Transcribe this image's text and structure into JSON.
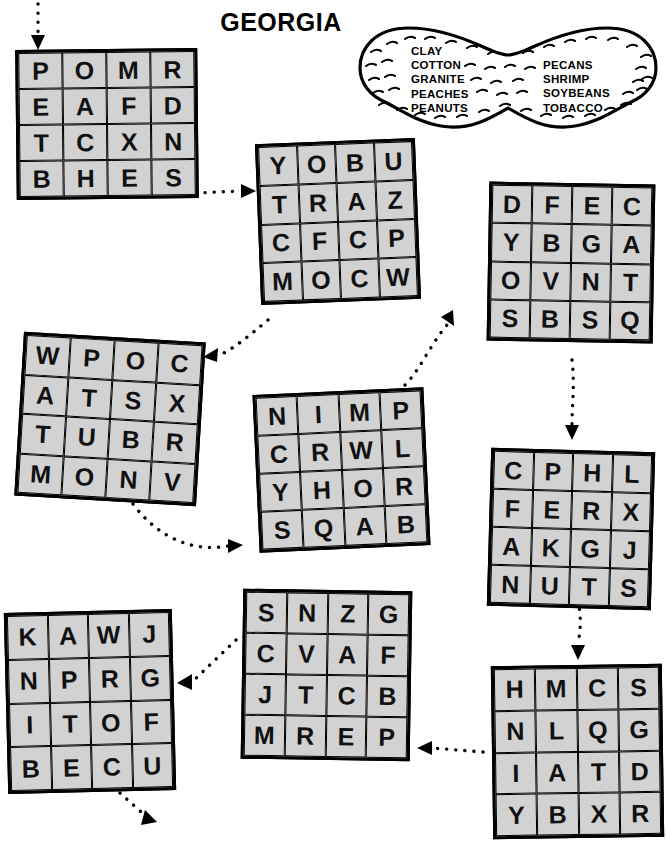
{
  "title": "GEORGIA",
  "callout": {
    "shape": "peanut",
    "words_left": [
      "CLAY",
      "COTTON",
      "GRANITE",
      "PEACHES",
      "PEANUTS"
    ],
    "words_right": [
      "PECANS",
      "SHRIMP",
      "SOYBEANS",
      "TOBACCO"
    ],
    "words_left_text": "CLAY\nCOTTON\nGRANITE\nPEACHES\nPEANUTS",
    "words_right_text": "PECANS\nSHRIMP\nSOYBEANS\nTOBACCO"
  },
  "colors": {
    "cell_fill": "#d2d2d2",
    "ink": "#000000",
    "page": "#ffffff"
  },
  "grids": [
    {
      "id": "grid-1",
      "rows": [
        [
          "P",
          "O",
          "M",
          "R"
        ],
        [
          "E",
          "A",
          "F",
          "D"
        ],
        [
          "T",
          "C",
          "X",
          "N"
        ],
        [
          "B",
          "H",
          "E",
          "S"
        ]
      ],
      "flat": "POMR EAFD TCXN BHES"
    },
    {
      "id": "grid-2",
      "rows": [
        [
          "Y",
          "O",
          "B",
          "U"
        ],
        [
          "T",
          "R",
          "A",
          "Z"
        ],
        [
          "C",
          "F",
          "C",
          "P"
        ],
        [
          "M",
          "O",
          "C",
          "W"
        ]
      ],
      "flat": "YOBU TRAZ CFCP MOCW"
    },
    {
      "id": "grid-3",
      "rows": [
        [
          "D",
          "F",
          "E",
          "C"
        ],
        [
          "Y",
          "B",
          "G",
          "A"
        ],
        [
          "O",
          "V",
          "N",
          "T"
        ],
        [
          "S",
          "B",
          "S",
          "Q"
        ]
      ],
      "flat": "DFEC YBGA OVNT SBSQ"
    },
    {
      "id": "grid-4",
      "rows": [
        [
          "W",
          "P",
          "O",
          "C"
        ],
        [
          "A",
          "T",
          "S",
          "X"
        ],
        [
          "T",
          "U",
          "B",
          "R"
        ],
        [
          "M",
          "O",
          "N",
          "V"
        ]
      ],
      "flat": "WPOC ATSX TUBR MONV"
    },
    {
      "id": "grid-5",
      "rows": [
        [
          "N",
          "I",
          "M",
          "P"
        ],
        [
          "C",
          "R",
          "W",
          "L"
        ],
        [
          "Y",
          "H",
          "O",
          "R"
        ],
        [
          "S",
          "Q",
          "A",
          "B"
        ]
      ],
      "flat": "NIMP CRWL YHOR SQAB"
    },
    {
      "id": "grid-6",
      "rows": [
        [
          "C",
          "P",
          "H",
          "L"
        ],
        [
          "F",
          "E",
          "R",
          "X"
        ],
        [
          "A",
          "K",
          "G",
          "J"
        ],
        [
          "N",
          "U",
          "T",
          "S"
        ]
      ],
      "flat": "CPHL FERX AKGJ NUTS"
    },
    {
      "id": "grid-7",
      "rows": [
        [
          "K",
          "A",
          "W",
          "J"
        ],
        [
          "N",
          "P",
          "R",
          "G"
        ],
        [
          "I",
          "T",
          "O",
          "F"
        ],
        [
          "B",
          "E",
          "C",
          "U"
        ]
      ],
      "flat": "KAWJ NPRG ITOF BECU"
    },
    {
      "id": "grid-8",
      "rows": [
        [
          "S",
          "N",
          "Z",
          "G"
        ],
        [
          "C",
          "V",
          "A",
          "F"
        ],
        [
          "J",
          "T",
          "C",
          "B"
        ],
        [
          "M",
          "R",
          "E",
          "P"
        ]
      ],
      "flat": "SNZG CVAF JTCB MREP"
    },
    {
      "id": "grid-9",
      "rows": [
        [
          "H",
          "M",
          "C",
          "S"
        ],
        [
          "N",
          "L",
          "Q",
          "G"
        ],
        [
          "I",
          "A",
          "T",
          "D"
        ],
        [
          "Y",
          "B",
          "X",
          "R"
        ]
      ],
      "flat": "HMCS NLQG IATD YBXR"
    }
  ],
  "connectors": [
    {
      "name": "entry-arrow",
      "from": "start",
      "to": "grid-1",
      "direction": "down"
    },
    {
      "name": "grid1-to-grid2",
      "from": "grid-1",
      "to": "grid-2",
      "direction": "right"
    },
    {
      "name": "grid2-to-grid3",
      "from": "grid-2",
      "to": "grid-3",
      "direction": "up-right"
    },
    {
      "name": "grid3-to-grid6",
      "from": "grid-3",
      "to": "grid-6",
      "direction": "down"
    },
    {
      "name": "grid5-to-grid3",
      "from": "grid-5",
      "to": "grid-3",
      "direction": "up-right"
    },
    {
      "name": "grid4-to-grid5",
      "from": "grid-4",
      "to": "grid-5",
      "direction": "right"
    },
    {
      "name": "grid2-to-grid4",
      "from": "grid-2",
      "to": "grid-4",
      "direction": "down-left"
    },
    {
      "name": "grid6-to-grid9",
      "from": "grid-6",
      "to": "grid-9",
      "direction": "down"
    },
    {
      "name": "grid9-to-grid8",
      "from": "grid-9",
      "to": "grid-8",
      "direction": "left"
    },
    {
      "name": "grid8-to-grid7",
      "from": "grid-8",
      "to": "grid-7",
      "direction": "left"
    },
    {
      "name": "exit-arrow",
      "from": "grid-7",
      "to": "end",
      "direction": "down-right"
    }
  ]
}
